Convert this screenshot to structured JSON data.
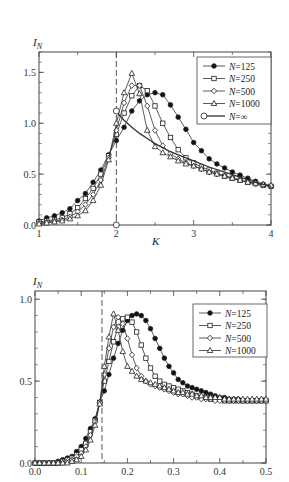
{
  "chart_data": [
    {
      "type": "line",
      "title": "",
      "xlabel": "K",
      "ylabel": "I_N",
      "ylabel_main": "I",
      "ylabel_sub": "N",
      "xlim": [
        1,
        4
      ],
      "ylim": [
        0,
        1.7
      ],
      "x_ticks": [
        1,
        2,
        3,
        4
      ],
      "x_tick_labels": [
        "1",
        "2",
        "3",
        "4"
      ],
      "y_ticks": [
        0.0,
        0.5,
        1.0,
        1.5
      ],
      "y_tick_labels": [
        "0.0",
        "0.5",
        "1.0",
        "1.5"
      ],
      "grid": false,
      "legend_position": "upper right",
      "annotations": [
        {
          "type": "vertical-dashed-line",
          "x": 2.0
        }
      ],
      "series": [
        {
          "name": "N=125",
          "marker": "filled-circle",
          "x": [
            1.0,
            1.1,
            1.2,
            1.3,
            1.4,
            1.5,
            1.6,
            1.7,
            1.8,
            1.9,
            2.0,
            2.1,
            2.2,
            2.3,
            2.4,
            2.5,
            2.6,
            2.7,
            2.8,
            2.9,
            3.0,
            3.1,
            3.2,
            3.3,
            3.4,
            3.5,
            3.6,
            3.7,
            3.8,
            3.9,
            4.0
          ],
          "y": [
            0.04,
            0.07,
            0.09,
            0.12,
            0.16,
            0.24,
            0.31,
            0.42,
            0.54,
            0.69,
            0.83,
            0.96,
            1.12,
            1.22,
            1.28,
            1.3,
            1.28,
            1.18,
            1.06,
            0.94,
            0.81,
            0.73,
            0.65,
            0.6,
            0.56,
            0.52,
            0.49,
            0.46,
            0.43,
            0.4,
            0.38
          ]
        },
        {
          "name": "N=250",
          "marker": "open-square",
          "x": [
            1.0,
            1.1,
            1.2,
            1.3,
            1.4,
            1.5,
            1.6,
            1.7,
            1.8,
            1.9,
            2.0,
            2.1,
            2.2,
            2.3,
            2.4,
            2.5,
            2.6,
            2.7,
            2.8,
            2.9,
            3.0,
            3.1,
            3.2,
            3.3,
            3.4,
            3.5,
            3.6,
            3.7,
            3.8,
            3.9,
            4.0
          ],
          "y": [
            0.03,
            0.04,
            0.05,
            0.07,
            0.11,
            0.17,
            0.26,
            0.36,
            0.5,
            0.68,
            0.89,
            1.1,
            1.27,
            1.37,
            1.32,
            1.17,
            1.0,
            0.86,
            0.74,
            0.66,
            0.61,
            0.57,
            0.54,
            0.51,
            0.48,
            0.46,
            0.44,
            0.42,
            0.41,
            0.39,
            0.38
          ]
        },
        {
          "name": "N=500",
          "marker": "open-diamond",
          "x": [
            1.0,
            1.1,
            1.2,
            1.3,
            1.4,
            1.5,
            1.6,
            1.7,
            1.8,
            1.9,
            2.0,
            2.1,
            2.2,
            2.3,
            2.4,
            2.5,
            2.6,
            2.7,
            2.8,
            2.9,
            3.0,
            3.1,
            3.2,
            3.3,
            3.4,
            3.5,
            3.6,
            3.7,
            3.8,
            3.9,
            4.0
          ],
          "y": [
            0.02,
            0.03,
            0.04,
            0.05,
            0.08,
            0.13,
            0.2,
            0.3,
            0.44,
            0.66,
            0.93,
            1.2,
            1.37,
            1.37,
            1.17,
            0.93,
            0.78,
            0.7,
            0.65,
            0.61,
            0.58,
            0.55,
            0.52,
            0.5,
            0.48,
            0.46,
            0.44,
            0.42,
            0.4,
            0.39,
            0.38
          ]
        },
        {
          "name": "N=1000",
          "marker": "open-triangle",
          "x": [
            1.0,
            1.1,
            1.2,
            1.3,
            1.4,
            1.5,
            1.6,
            1.7,
            1.8,
            1.9,
            2.0,
            2.1,
            2.2,
            2.3,
            2.4,
            2.5,
            2.6,
            2.7,
            2.8,
            2.9,
            3.0,
            3.1,
            3.2,
            3.3,
            3.4,
            3.5,
            3.6,
            3.7,
            3.8,
            3.9,
            4.0
          ],
          "y": [
            0.01,
            0.02,
            0.03,
            0.04,
            0.06,
            0.09,
            0.14,
            0.24,
            0.39,
            0.64,
            1.0,
            1.3,
            1.49,
            1.29,
            0.93,
            0.77,
            0.71,
            0.67,
            0.63,
            0.6,
            0.58,
            0.55,
            0.52,
            0.5,
            0.48,
            0.46,
            0.44,
            0.42,
            0.41,
            0.4,
            0.39
          ]
        },
        {
          "name": "N=∞",
          "marker": "open-circle-line",
          "x": [
            2.0,
            2.1,
            2.2,
            2.3,
            2.4,
            2.5,
            2.6,
            2.7,
            2.8,
            2.9,
            3.0,
            3.2,
            3.4,
            3.6,
            3.8,
            4.0
          ],
          "y": [
            1.11,
            1.03,
            0.96,
            0.9,
            0.85,
            0.8,
            0.76,
            0.72,
            0.69,
            0.66,
            0.63,
            0.57,
            0.52,
            0.47,
            0.42,
            0.38
          ],
          "open_points": [
            {
              "x": 2.0,
              "y": 1.12
            },
            {
              "x": 2.0,
              "y": 0.0
            }
          ]
        }
      ]
    },
    {
      "type": "line",
      "title": "",
      "xlabel": "",
      "ylabel": "I_N",
      "ylabel_main": "I",
      "ylabel_sub": "N",
      "xlim": [
        0,
        0.5
      ],
      "ylim": [
        0,
        1.05
      ],
      "x_ticks": [
        0.0,
        0.1,
        0.2,
        0.3,
        0.4,
        0.5
      ],
      "x_tick_labels": [
        "0.0",
        "0.1",
        "0.2",
        "0.3",
        "0.4",
        "0.5"
      ],
      "y_ticks": [
        0.0,
        0.5,
        1.0
      ],
      "y_tick_labels": [
        "0.0",
        "0.5",
        "1.0"
      ],
      "grid": false,
      "legend_position": "upper right",
      "annotations": [
        {
          "type": "vertical-dashed-line",
          "x": 0.145
        }
      ],
      "series": [
        {
          "name": "N=125",
          "marker": "filled-circle",
          "x": [
            0.0,
            0.01,
            0.02,
            0.03,
            0.04,
            0.05,
            0.06,
            0.07,
            0.08,
            0.09,
            0.1,
            0.11,
            0.12,
            0.13,
            0.14,
            0.15,
            0.16,
            0.17,
            0.18,
            0.19,
            0.2,
            0.21,
            0.22,
            0.23,
            0.24,
            0.25,
            0.26,
            0.27,
            0.28,
            0.29,
            0.3,
            0.31,
            0.32,
            0.33,
            0.34,
            0.35,
            0.36,
            0.37,
            0.38,
            0.39,
            0.4,
            0.41,
            0.42,
            0.43,
            0.44,
            0.45,
            0.46,
            0.47,
            0.48,
            0.49,
            0.5
          ],
          "y": [
            0.0,
            0.0,
            0.0,
            0.0,
            0.0,
            0.01,
            0.02,
            0.03,
            0.04,
            0.07,
            0.1,
            0.15,
            0.21,
            0.27,
            0.37,
            0.44,
            0.54,
            0.64,
            0.73,
            0.81,
            0.87,
            0.9,
            0.91,
            0.9,
            0.87,
            0.82,
            0.76,
            0.7,
            0.64,
            0.59,
            0.55,
            0.51,
            0.49,
            0.47,
            0.46,
            0.45,
            0.44,
            0.43,
            0.42,
            0.41,
            0.4,
            0.4,
            0.39,
            0.39,
            0.39,
            0.38,
            0.38,
            0.38,
            0.38,
            0.38,
            0.38
          ]
        },
        {
          "name": "N=250",
          "marker": "open-square",
          "x": [
            0.0,
            0.01,
            0.02,
            0.03,
            0.04,
            0.05,
            0.06,
            0.07,
            0.08,
            0.09,
            0.1,
            0.11,
            0.12,
            0.13,
            0.14,
            0.15,
            0.16,
            0.17,
            0.18,
            0.19,
            0.2,
            0.21,
            0.22,
            0.23,
            0.24,
            0.25,
            0.26,
            0.27,
            0.28,
            0.29,
            0.3,
            0.31,
            0.32,
            0.33,
            0.34,
            0.35,
            0.36,
            0.37,
            0.38,
            0.39,
            0.4,
            0.41,
            0.42,
            0.43,
            0.44,
            0.45,
            0.46,
            0.47,
            0.48,
            0.49,
            0.5
          ],
          "y": [
            0.0,
            0.0,
            0.0,
            0.0,
            0.0,
            0.0,
            0.01,
            0.02,
            0.03,
            0.05,
            0.08,
            0.12,
            0.19,
            0.26,
            0.37,
            0.5,
            0.62,
            0.74,
            0.83,
            0.88,
            0.89,
            0.86,
            0.8,
            0.72,
            0.64,
            0.58,
            0.53,
            0.5,
            0.48,
            0.47,
            0.46,
            0.45,
            0.44,
            0.43,
            0.42,
            0.41,
            0.4,
            0.4,
            0.39,
            0.39,
            0.39,
            0.38,
            0.38,
            0.38,
            0.38,
            0.38,
            0.38,
            0.38,
            0.38,
            0.38,
            0.38
          ]
        },
        {
          "name": "N=500",
          "marker": "open-diamond",
          "x": [
            0.0,
            0.01,
            0.02,
            0.03,
            0.04,
            0.05,
            0.06,
            0.07,
            0.08,
            0.09,
            0.1,
            0.11,
            0.12,
            0.13,
            0.14,
            0.15,
            0.16,
            0.17,
            0.18,
            0.19,
            0.2,
            0.21,
            0.22,
            0.23,
            0.24,
            0.25,
            0.26,
            0.27,
            0.28,
            0.29,
            0.3,
            0.31,
            0.32,
            0.33,
            0.34,
            0.35,
            0.36,
            0.37,
            0.38,
            0.39,
            0.4,
            0.41,
            0.42,
            0.43,
            0.44,
            0.45,
            0.46,
            0.47,
            0.48,
            0.49,
            0.5
          ],
          "y": [
            0.0,
            0.0,
            0.0,
            0.0,
            0.0,
            0.0,
            0.0,
            0.01,
            0.02,
            0.04,
            0.06,
            0.1,
            0.17,
            0.25,
            0.37,
            0.54,
            0.7,
            0.83,
            0.89,
            0.85,
            0.76,
            0.66,
            0.58,
            0.53,
            0.5,
            0.48,
            0.47,
            0.46,
            0.45,
            0.44,
            0.43,
            0.42,
            0.42,
            0.41,
            0.4,
            0.4,
            0.39,
            0.39,
            0.39,
            0.38,
            0.38,
            0.38,
            0.38,
            0.38,
            0.38,
            0.38,
            0.38,
            0.38,
            0.38,
            0.38,
            0.38
          ]
        },
        {
          "name": "N=1000",
          "marker": "open-triangle",
          "x": [
            0.0,
            0.01,
            0.02,
            0.03,
            0.04,
            0.05,
            0.06,
            0.07,
            0.08,
            0.09,
            0.1,
            0.11,
            0.12,
            0.13,
            0.14,
            0.15,
            0.16,
            0.17,
            0.18,
            0.19,
            0.2,
            0.21,
            0.22,
            0.23,
            0.24,
            0.25,
            0.26,
            0.27,
            0.28,
            0.29,
            0.3,
            0.31,
            0.32,
            0.33,
            0.34,
            0.35,
            0.36,
            0.37,
            0.38,
            0.39,
            0.4,
            0.41,
            0.42,
            0.43,
            0.44,
            0.45,
            0.46,
            0.47,
            0.48,
            0.49,
            0.5
          ],
          "y": [
            0.0,
            0.0,
            0.0,
            0.0,
            0.0,
            0.0,
            0.0,
            0.0,
            0.01,
            0.02,
            0.04,
            0.08,
            0.14,
            0.23,
            0.36,
            0.59,
            0.77,
            0.91,
            0.81,
            0.68,
            0.59,
            0.56,
            0.53,
            0.51,
            0.5,
            0.49,
            0.48,
            0.47,
            0.46,
            0.45,
            0.44,
            0.43,
            0.43,
            0.42,
            0.42,
            0.41,
            0.41,
            0.4,
            0.4,
            0.4,
            0.4,
            0.39,
            0.39,
            0.39,
            0.39,
            0.39,
            0.39,
            0.39,
            0.39,
            0.39,
            0.39
          ]
        }
      ]
    }
  ],
  "charts": [
    {
      "ylabel_main": "I",
      "ylabel_sub": "N",
      "xlabel": "K",
      "legend": [
        "N=125",
        "N=250",
        "N=500",
        "N=1000",
        "N=∞"
      ]
    },
    {
      "ylabel_main": "I",
      "ylabel_sub": "N",
      "legend": [
        "N=125",
        "N=250",
        "N=500",
        "N=1000"
      ]
    }
  ]
}
